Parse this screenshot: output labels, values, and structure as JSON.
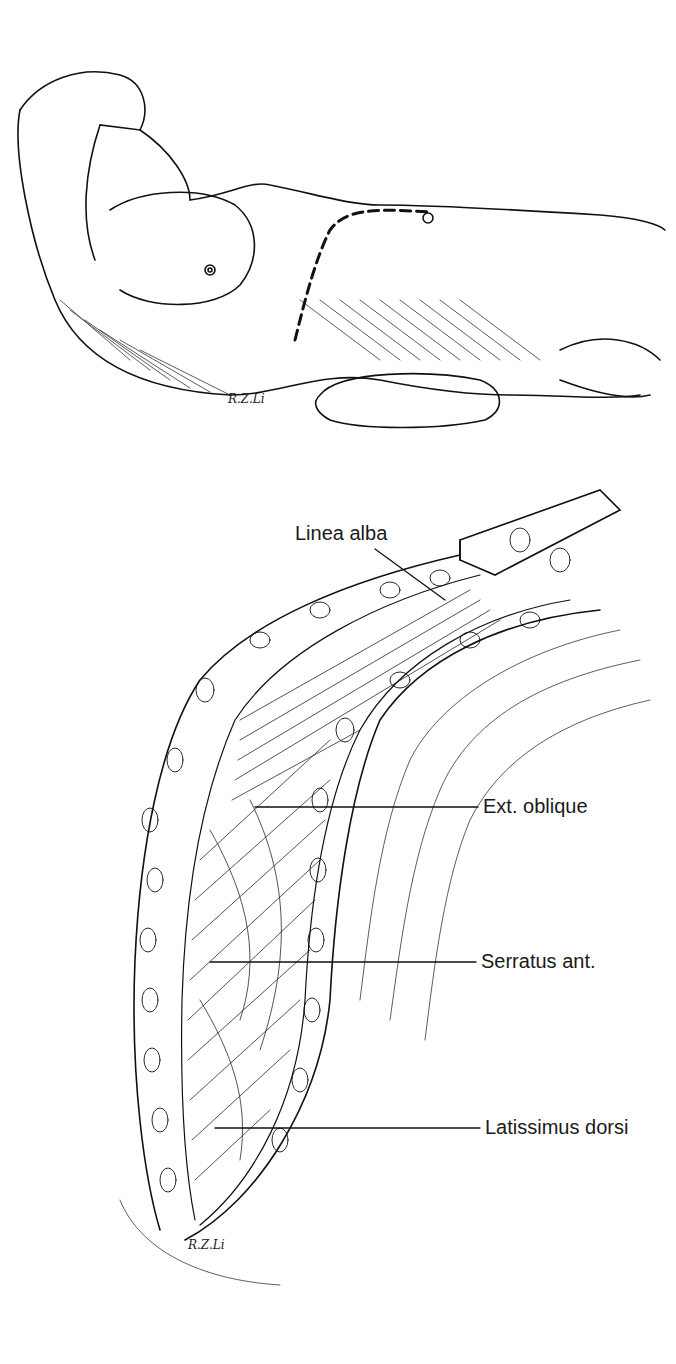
{
  "figure": {
    "top_panel": {
      "description": "Patient in lateral position with dashed incision line",
      "signature": "R.Z.Li"
    },
    "bottom_panel": {
      "description": "Exposed thoracoabdominal musculature with retractor",
      "signature": "R.Z.Li",
      "labels": [
        {
          "text": "Linea alba"
        },
        {
          "text": "Ext. oblique"
        },
        {
          "text": "Serratus ant."
        },
        {
          "text": "Latissimus dorsi"
        }
      ]
    }
  }
}
